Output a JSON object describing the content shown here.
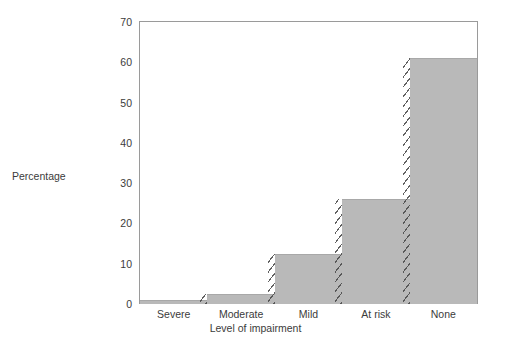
{
  "chart_data": {
    "type": "bar",
    "title": "",
    "subtitle": "",
    "categories": [
      "Severe",
      "Moderate",
      "Mild",
      "At risk",
      "None"
    ],
    "values": [
      1,
      2.5,
      12.5,
      26,
      61
    ],
    "xlabel": "Level of impairment",
    "ylabel": "Percentage",
    "ylim": [
      0,
      70
    ],
    "yticks": [
      0,
      10,
      20,
      30,
      40,
      50,
      60,
      70
    ],
    "ytick_labels": [
      "0",
      "10",
      "20",
      "30",
      "40",
      "50",
      "60",
      "70"
    ],
    "grid": false,
    "legend": false,
    "legend_position": "none",
    "bar_style": "adjoining",
    "annotations": [
      "diagonal slash hatching on the vertical risers between adjacent bars"
    ],
    "colors": {
      "bar_fill": "#b9b9b9",
      "bar_edge": "#a8a8a8",
      "axis_line": "#9a9a9a",
      "text": "#3b3b3b",
      "background": "#ffffff",
      "hatch": "#464646"
    }
  },
  "axes": {
    "y_title": "Percentage",
    "x_title": "Level of impairment"
  }
}
